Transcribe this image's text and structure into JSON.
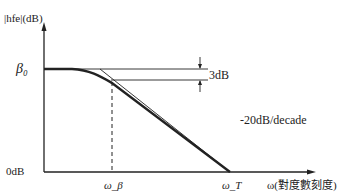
{
  "diagram": {
    "y_axis_label": "|hfe|(dB)",
    "x_axis_label": "ω(對度數刻度)",
    "y_ticks": {
      "beta0": "β₀",
      "zero": "0dB"
    },
    "x_ticks": {
      "omega_beta": "ω_β",
      "omega_T": "ω_T"
    },
    "annotations": {
      "three_db": "3dB",
      "slope": "-20dB/decade"
    },
    "colors": {
      "line": "#222222",
      "background": "#ffffff"
    }
  }
}
